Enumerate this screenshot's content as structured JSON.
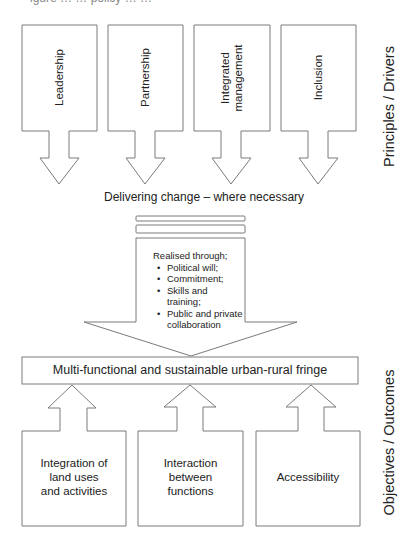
{
  "figure": {
    "cutoff_top_text": "igure … … policy … …"
  },
  "principles": {
    "side_label": "Principles / Drivers",
    "boxes": [
      {
        "lines": [
          "Leadership"
        ]
      },
      {
        "lines": [
          "Partnership"
        ]
      },
      {
        "lines": [
          "Integrated",
          "management"
        ]
      },
      {
        "lines": [
          "Inclusion"
        ]
      }
    ]
  },
  "delivering": {
    "label": "Delivering change – where necessary",
    "realised_heading": "Realised through;",
    "realised_items": [
      "Political will;",
      "Commitment;",
      "Skills and training;",
      "Public and private collaboration"
    ]
  },
  "outcome_bar": {
    "label": "Multi-functional and sustainable urban-rural fringe"
  },
  "objectives": {
    "side_label": "Objectives / Outcomes",
    "boxes": [
      {
        "lines": [
          "Integration of",
          "land uses",
          "and activities"
        ]
      },
      {
        "lines": [
          "Interaction",
          "between",
          "functions"
        ]
      },
      {
        "lines": [
          "Accessibility"
        ]
      }
    ]
  },
  "colors": {
    "stroke": "#7a7a7a",
    "fill": "#ffffff",
    "text": "#222222"
  }
}
